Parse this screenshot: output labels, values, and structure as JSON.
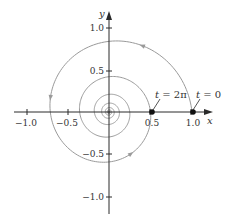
{
  "chart_data": {
    "type": "line",
    "title": "",
    "xlabel": "x",
    "ylabel": "y",
    "xlim": [
      -1.0,
      1.0
    ],
    "ylim": [
      -1.0,
      1.0
    ],
    "x_ticks": [
      -1.0,
      -0.5,
      0.5,
      1.0
    ],
    "x_tick_labels": [
      "−1.0",
      "−0.5",
      "0.5",
      "1.0"
    ],
    "y_ticks": [
      1.0,
      0.5,
      -0.5,
      -1.0
    ],
    "y_tick_labels": [
      "1.0",
      "0.5",
      "−0.5",
      "−1.0"
    ],
    "grid": false,
    "legend": null,
    "series": [
      {
        "name": "spiral",
        "parametric": "x = (1/2)^(t/2π) cos t, y = (1/2)^(t/2π) sin t",
        "t_range": [
          0,
          50
        ],
        "color": "#9a9a9a",
        "direction_arrows_at_t": [
          1.1,
          2.9,
          5.2
        ]
      }
    ],
    "points": [
      {
        "x": 1.0,
        "y": 0,
        "label": "t = 0"
      },
      {
        "x": 0.5,
        "y": 0,
        "label": "t = 2π"
      }
    ],
    "annotations": [
      {
        "text": "t = 0",
        "target": [
          1.0,
          0
        ]
      },
      {
        "text": "t = 2π",
        "target": [
          0.5,
          0
        ]
      }
    ]
  },
  "labels": {
    "x_axis": "x",
    "y_axis": "y",
    "ann_t0_var": "t",
    "ann_t0_rest": " = 0",
    "ann_t2pi_var": "t",
    "ann_t2pi_rest": " = 2π",
    "xt0": "−1.0",
    "xt1": "−0.5",
    "xt2": "0.5",
    "xt3": "1.0",
    "yt0": "1.0",
    "yt1": "0.5",
    "yt2": "−0.5",
    "yt3": "−1.0"
  },
  "colors": {
    "axis": "#2a2a2a",
    "curve": "#9a9a9a",
    "point": "#111111"
  }
}
